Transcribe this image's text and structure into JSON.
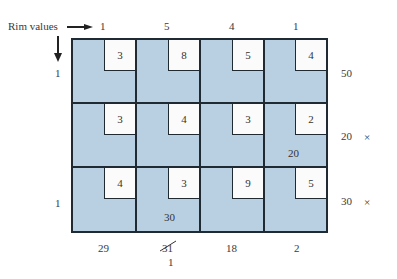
{
  "legend": {
    "rim_values_label": "Rim values"
  },
  "column_rims": [
    "1",
    "5",
    "4",
    "1"
  ],
  "row_rims": [
    "1",
    "",
    "1"
  ],
  "supply": [
    "50",
    "20",
    "30"
  ],
  "supply_marks": [
    "",
    "×",
    "×"
  ],
  "demand": [
    "29",
    "31",
    "18",
    "2"
  ],
  "demand_correction": {
    "column": 1,
    "new_value": "1"
  },
  "costs": [
    [
      "3",
      "8",
      "5",
      "4"
    ],
    [
      "3",
      "4",
      "3",
      "2"
    ],
    [
      "4",
      "3",
      "9",
      "5"
    ]
  ],
  "allocations": [
    [
      "",
      "",
      "",
      ""
    ],
    [
      "",
      "",
      "",
      "20"
    ],
    [
      "",
      "30",
      "",
      ""
    ]
  ],
  "colors": {
    "cell_fill": "#b9d0e3",
    "cost_box": "#fbfbfb",
    "border": "#1f2a33"
  }
}
